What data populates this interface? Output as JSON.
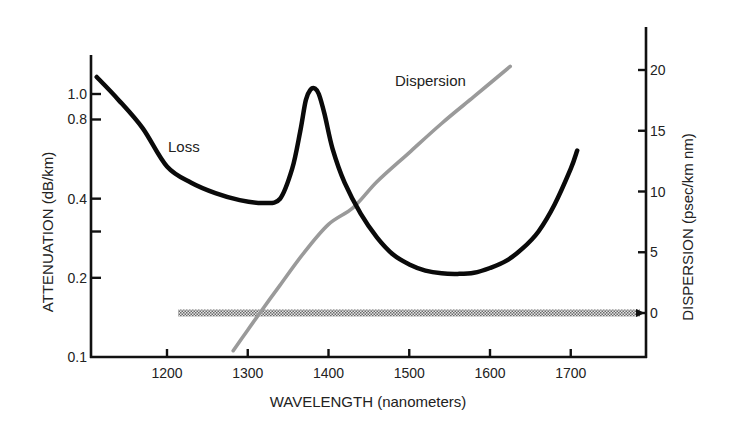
{
  "chart_data": {
    "type": "line",
    "title": "",
    "xlabel": "WAVELENGTH (nanometers)",
    "ylabel": "ATTENUATION (dB/km)",
    "y2label": "DISPERSION (psec/km nm)",
    "xlim": [
      1115,
      1795
    ],
    "ylim": [
      0.1,
      1.4
    ],
    "yscale": "log",
    "y2lim": [
      -3.6,
      23.5
    ],
    "grid": false,
    "legend": "none (inline annotations)",
    "x_ticks": [
      1200,
      1300,
      1400,
      1500,
      1600,
      1700
    ],
    "x_tick_labels": [
      "1200",
      "1300",
      "1400",
      "1500",
      "1600",
      "1700"
    ],
    "y_ticks": [
      0.1,
      0.2,
      0.3,
      0.4,
      0.8,
      1.0
    ],
    "y_tick_labels": [
      "0.1",
      "0.2",
      "",
      "0.4",
      "0.8",
      "1.0"
    ],
    "y2_ticks": [
      0,
      5,
      10,
      15,
      20
    ],
    "y2_tick_labels": [
      "0",
      "5",
      "10",
      "15",
      "20"
    ],
    "annotations": [
      {
        "text": "Loss",
        "x": 1230,
        "y": 0.62
      },
      {
        "text": "Dispersion",
        "x": 1450,
        "y2": 19.5
      }
    ],
    "series": [
      {
        "name": "Loss",
        "axis": "left",
        "color": "#0a0a0a",
        "x": [
          1113,
          1140,
          1170,
          1200,
          1230,
          1260,
          1290,
          1320,
          1340,
          1355,
          1365,
          1372,
          1378,
          1383,
          1388,
          1395,
          1405,
          1420,
          1440,
          1460,
          1480,
          1500,
          1520,
          1540,
          1560,
          1580,
          1600,
          1620,
          1640,
          1660,
          1680,
          1700,
          1708
        ],
        "values": [
          1.16,
          0.95,
          0.74,
          0.53,
          0.46,
          0.42,
          0.395,
          0.385,
          0.4,
          0.52,
          0.72,
          0.95,
          1.04,
          1.05,
          1.0,
          0.84,
          0.62,
          0.46,
          0.35,
          0.285,
          0.245,
          0.225,
          0.213,
          0.208,
          0.207,
          0.209,
          0.218,
          0.232,
          0.258,
          0.3,
          0.38,
          0.52,
          0.61
        ]
      },
      {
        "name": "Dispersion",
        "axis": "right",
        "color": "#9a9a9a",
        "x": [
          1282,
          1300,
          1315,
          1340,
          1370,
          1400,
          1431,
          1460,
          1500,
          1540,
          1580,
          1625
        ],
        "values": [
          -3.1,
          -1.4,
          0.0,
          2.3,
          5.0,
          7.3,
          8.7,
          10.8,
          13.2,
          15.6,
          17.8,
          20.3
        ]
      },
      {
        "name": "Zero dispersion reference",
        "axis": "right",
        "style": "dithered band",
        "color": "#7a7a7a",
        "x": [
          1215,
          1795
        ],
        "values": [
          0,
          0
        ]
      }
    ]
  },
  "labels": {
    "xlabel": "WAVELENGTH (nanometers)",
    "ylabel": "ATTENUATION (dB/km)",
    "y2label": "DISPERSION (psec/km nm)",
    "loss_annotation": "Loss",
    "dispersion_annotation": "Dispersion"
  }
}
